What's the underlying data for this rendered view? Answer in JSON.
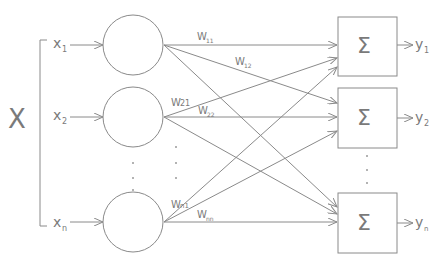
{
  "diagram": {
    "type": "single-layer neural network",
    "input_vector_label": "X",
    "inputs": [
      {
        "label": "x",
        "sub": "1"
      },
      {
        "label": "x",
        "sub": "2"
      },
      {
        "label": "x",
        "sub": "n"
      }
    ],
    "outputs": [
      {
        "label": "y",
        "sub": "1"
      },
      {
        "label": "y",
        "sub": "2"
      },
      {
        "label": "y",
        "sub": "n"
      }
    ],
    "summation_symbol": "Σ",
    "weights": [
      {
        "label": "W",
        "sub": "11"
      },
      {
        "label": "W",
        "sub": "12"
      },
      {
        "label": "W",
        "sub": "21"
      },
      {
        "label": "W",
        "sub": "22"
      },
      {
        "label": "W",
        "sub": "n1"
      },
      {
        "label": "W",
        "sub": "nn"
      }
    ],
    "ellipsis": "⋮"
  },
  "colors": {
    "stroke": "#8a8a8a",
    "text": "#7a7a7a",
    "background": "#ffffff"
  }
}
